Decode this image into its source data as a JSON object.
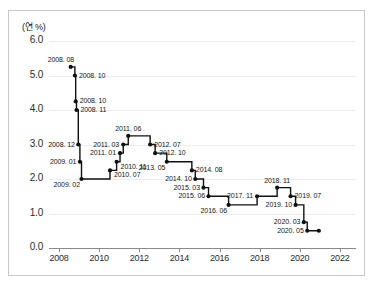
{
  "chart_data": {
    "type": "line",
    "line_style": "step-post",
    "title": "",
    "subtitle": "",
    "xlabel": "",
    "ylabel": "(연 %)",
    "ylim": [
      0.0,
      6.0
    ],
    "xlim": [
      2007.5,
      2022.8
    ],
    "grid": true,
    "grid_axis": "y",
    "legend": false,
    "legend_position": "none",
    "y_ticks": [
      "0.0",
      "1.0",
      "2.0",
      "3.0",
      "4.0",
      "5.0",
      "6.0"
    ],
    "y_tick_values": [
      0.0,
      1.0,
      2.0,
      3.0,
      4.0,
      5.0,
      6.0
    ],
    "x_ticks": [
      "2008",
      "2010",
      "2012",
      "2014",
      "2016",
      "2018",
      "2020",
      "2022"
    ],
    "x_tick_values": [
      2008,
      2010,
      2012,
      2014,
      2016,
      2018,
      2020,
      2022
    ],
    "series": [
      {
        "name": "기준금리",
        "color": "#111111",
        "points": [
          {
            "label": "2008. 08",
            "x": 2008.58,
            "y": 5.25,
            "label_pos": "above-left"
          },
          {
            "label": "2008. 10",
            "x": 2008.79,
            "y": 5.0,
            "label_pos": "right"
          },
          {
            "label": "2008. 10",
            "x": 2008.83,
            "y": 4.25,
            "label_pos": "right"
          },
          {
            "label": "2008. 11",
            "x": 2008.87,
            "y": 4.0,
            "label_pos": "right"
          },
          {
            "label": "2008. 12",
            "x": 2008.96,
            "y": 3.0,
            "label_pos": "left"
          },
          {
            "label": "2009. 01",
            "x": 2009.04,
            "y": 2.5,
            "label_pos": "left"
          },
          {
            "label": "2009. 02",
            "x": 2009.12,
            "y": 2.0,
            "label_pos": "below-left"
          },
          {
            "label": "2010. 07",
            "x": 2010.54,
            "y": 2.25,
            "label_pos": "below-right"
          },
          {
            "label": "2010. 11",
            "x": 2010.87,
            "y": 2.5,
            "label_pos": "below-right"
          },
          {
            "label": "2011. 01",
            "x": 2011.04,
            "y": 2.75,
            "label_pos": "left"
          },
          {
            "label": "2011. 03",
            "x": 2011.2,
            "y": 3.0,
            "label_pos": "left"
          },
          {
            "label": "2011. 06",
            "x": 2011.45,
            "y": 3.25,
            "label_pos": "above"
          },
          {
            "label": "2012. 07",
            "x": 2012.54,
            "y": 3.0,
            "label_pos": "right"
          },
          {
            "label": "2012. 10",
            "x": 2012.79,
            "y": 2.75,
            "label_pos": "right"
          },
          {
            "label": "2013. 05",
            "x": 2013.37,
            "y": 2.5,
            "label_pos": "below-left"
          },
          {
            "label": "2014. 08",
            "x": 2014.62,
            "y": 2.25,
            "label_pos": "right"
          },
          {
            "label": "2014. 10",
            "x": 2014.79,
            "y": 2.0,
            "label_pos": "left"
          },
          {
            "label": "2015. 03",
            "x": 2015.2,
            "y": 1.75,
            "label_pos": "left"
          },
          {
            "label": "2015. 06",
            "x": 2015.45,
            "y": 1.5,
            "label_pos": "left"
          },
          {
            "label": "2016. 06",
            "x": 2016.45,
            "y": 1.25,
            "label_pos": "below-left"
          },
          {
            "label": "2017. 11",
            "x": 2017.87,
            "y": 1.5,
            "label_pos": "left"
          },
          {
            "label": "2018. 11",
            "x": 2018.87,
            "y": 1.75,
            "label_pos": "above"
          },
          {
            "label": "2019. 07",
            "x": 2019.54,
            "y": 1.5,
            "label_pos": "right"
          },
          {
            "label": "2019. 10",
            "x": 2019.79,
            "y": 1.25,
            "label_pos": "left"
          },
          {
            "label": "2020. 03",
            "x": 2020.2,
            "y": 0.75,
            "label_pos": "left"
          },
          {
            "label": "2020. 05",
            "x": 2020.37,
            "y": 0.5,
            "label_pos": "left"
          },
          {
            "label": "",
            "x": 2020.95,
            "y": 0.5,
            "label_pos": "none"
          }
        ]
      }
    ]
  }
}
